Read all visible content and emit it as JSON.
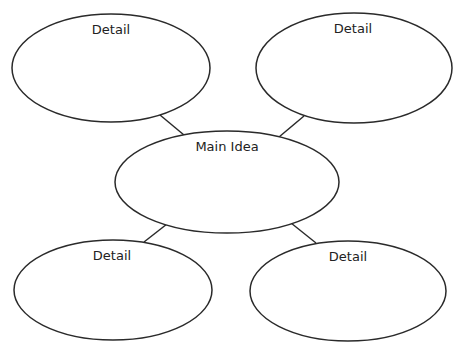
{
  "diagram": {
    "type": "idea-web",
    "stroke_color": "#2a2a2a",
    "center": {
      "id": "main",
      "label": "Main Idea"
    },
    "details": [
      {
        "id": "top-left",
        "label": "Detail"
      },
      {
        "id": "top-right",
        "label": "Detail"
      },
      {
        "id": "bottom-left",
        "label": "Detail"
      },
      {
        "id": "bottom-right",
        "label": "Detail"
      }
    ],
    "connections": [
      [
        "main",
        "top-left"
      ],
      [
        "main",
        "top-right"
      ],
      [
        "main",
        "bottom-left"
      ],
      [
        "main",
        "bottom-right"
      ]
    ]
  }
}
